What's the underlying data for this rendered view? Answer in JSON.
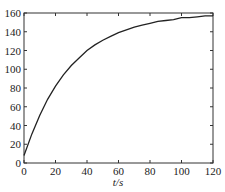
{
  "chart_data": {
    "type": "line",
    "title": "",
    "xlabel": "t/s",
    "ylabel": "",
    "xlim": [
      0,
      120
    ],
    "ylim": [
      0,
      160
    ],
    "xticks": [
      0,
      20,
      40,
      60,
      80,
      100,
      120
    ],
    "yticks": [
      0,
      20,
      40,
      60,
      80,
      100,
      120,
      140,
      160
    ],
    "grid": false,
    "legend": null,
    "series": [
      {
        "name": "curve",
        "color": "#222222",
        "x": [
          0,
          5,
          10,
          15,
          20,
          25,
          30,
          35,
          40,
          45,
          50,
          55,
          60,
          65,
          70,
          75,
          80,
          85,
          90,
          95,
          100,
          105,
          110,
          115,
          120
        ],
        "y": [
          8,
          31,
          51,
          68,
          82,
          94,
          104,
          112,
          120,
          126,
          131,
          135,
          139,
          142,
          145,
          147,
          149,
          151,
          152,
          153,
          155,
          155,
          156,
          157,
          157
        ]
      }
    ]
  }
}
